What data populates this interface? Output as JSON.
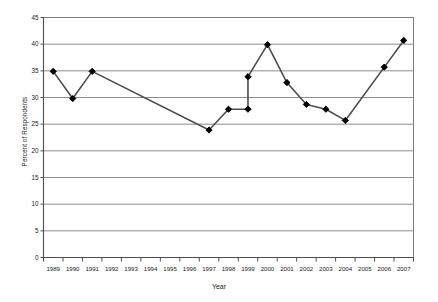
{
  "chart_data": {
    "type": "line",
    "title": "",
    "xlabel": "Year",
    "ylabel": "Percent of Respondents",
    "xlim": [
      1988.5,
      2007.5
    ],
    "ylim": [
      0,
      45
    ],
    "grid": true,
    "legend": "none",
    "marker": "filled-diamond",
    "line_color": "#4d4d4d",
    "marker_color": "#000000",
    "grid_color": "#808080",
    "categories": [
      "1989",
      "1990",
      "1991",
      "1992",
      "1993",
      "1994",
      "1995",
      "1996",
      "1997",
      "1998",
      "1999",
      "2000",
      "2001",
      "2002",
      "2003",
      "2004",
      "2005",
      "2006",
      "2007"
    ],
    "ytick_labels": [
      "0",
      "5",
      "10",
      "15",
      "20",
      "25",
      "30",
      "35",
      "40",
      "45"
    ],
    "ytick_values": [
      0,
      5,
      10,
      15,
      20,
      25,
      30,
      35,
      40,
      45
    ],
    "points": [
      {
        "x": 1989,
        "y": 34.9,
        "marker": true
      },
      {
        "x": 1990,
        "y": 29.8,
        "marker": true
      },
      {
        "x": 1991,
        "y": 34.9,
        "marker": true
      },
      {
        "x": 1997,
        "y": 23.9,
        "marker": true
      },
      {
        "x": 1998,
        "y": 27.8,
        "marker": true
      },
      {
        "x": 1999,
        "y": 27.8,
        "marker": true
      },
      {
        "x": 1999,
        "y": 33.9,
        "marker": true
      },
      {
        "x": 2000,
        "y": 39.9,
        "marker": true
      },
      {
        "x": 2001,
        "y": 32.8,
        "marker": true
      },
      {
        "x": 2002,
        "y": 28.7,
        "marker": true
      },
      {
        "x": 2003,
        "y": 27.8,
        "marker": true
      },
      {
        "x": 2004,
        "y": 25.7,
        "marker": true
      },
      {
        "x": 2006,
        "y": 35.7,
        "marker": true
      },
      {
        "x": 2007,
        "y": 40.7,
        "marker": true
      }
    ],
    "series": [
      {
        "name": "Percent of Respondents",
        "x": [
          1989,
          1990,
          1991,
          1997,
          1998,
          1999,
          1999,
          2000,
          2001,
          2002,
          2003,
          2004,
          2006,
          2007
        ],
        "values": [
          34.9,
          29.8,
          34.9,
          23.9,
          27.8,
          27.8,
          33.9,
          39.9,
          32.8,
          28.7,
          27.8,
          25.7,
          35.7,
          40.7
        ]
      }
    ]
  }
}
